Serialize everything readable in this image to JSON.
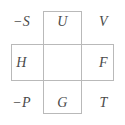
{
  "figure": {
    "type": "symbol-grid-cross-diagram",
    "colors": {
      "border": "#b9b9b9",
      "text": "#4a4a4a",
      "background": "#ffffff"
    },
    "grid": {
      "rows": 3,
      "columns": 3,
      "cells": [
        {
          "row": 0,
          "col": 0,
          "label": "−S",
          "empty": false
        },
        {
          "row": 0,
          "col": 1,
          "label": "U",
          "empty": false
        },
        {
          "row": 0,
          "col": 2,
          "label": "V",
          "empty": false
        },
        {
          "row": 1,
          "col": 0,
          "label": "H",
          "empty": false
        },
        {
          "row": 1,
          "col": 1,
          "label": "",
          "empty": true
        },
        {
          "row": 1,
          "col": 2,
          "label": "F",
          "empty": false
        },
        {
          "row": 2,
          "col": 0,
          "label": "−P",
          "empty": false
        },
        {
          "row": 2,
          "col": 1,
          "label": "G",
          "empty": false
        },
        {
          "row": 2,
          "col": 2,
          "label": "T",
          "empty": false
        }
      ]
    },
    "rectangles": [
      {
        "name": "vertical-rectangle",
        "spans": "middle-column"
      },
      {
        "name": "horizontal-rectangle",
        "spans": "middle-row"
      }
    ]
  }
}
